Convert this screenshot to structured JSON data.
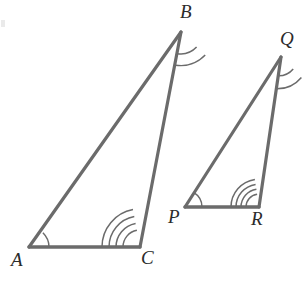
{
  "figure": {
    "type": "geometry-diagram",
    "background_color": "#ffffff",
    "stroke_color": "#6b6b6b",
    "arc_color": "#6b6b6b",
    "label_color": "#2b2b2b",
    "stroke_width": 3.2,
    "arc_width": 1.5,
    "width": 305,
    "height": 288
  },
  "triangles": [
    {
      "name": "triangle-ABC",
      "vertices": [
        {
          "label": "A",
          "x": 29,
          "y": 247,
          "label_x": 11,
          "label_y": 250,
          "arc_count": 1,
          "arc_radius": 20
        },
        {
          "label": "B",
          "x": 181,
          "y": 32,
          "label_x": 180,
          "label_y": 2,
          "arc_count": 2,
          "arc_radius": 22
        },
        {
          "label": "C",
          "x": 140,
          "y": 247,
          "label_x": 141,
          "label_y": 248,
          "arc_count": 4,
          "arc_radius": 38
        }
      ],
      "sides": [
        {
          "name": "side-AB",
          "from": "A",
          "to": "B"
        },
        {
          "name": "side-BC",
          "from": "B",
          "to": "C"
        },
        {
          "name": "side-AC",
          "from": "A",
          "to": "C"
        }
      ]
    },
    {
      "name": "triangle-PQR",
      "vertices": [
        {
          "label": "P",
          "x": 185,
          "y": 207,
          "label_x": 168,
          "label_y": 207,
          "arc_count": 1,
          "arc_radius": 17
        },
        {
          "label": "Q",
          "x": 281,
          "y": 57,
          "label_x": 280,
          "label_y": 29,
          "arc_count": 2,
          "arc_radius": 19
        },
        {
          "label": "R",
          "x": 259,
          "y": 207,
          "label_x": 251,
          "label_y": 209,
          "arc_count": 4,
          "arc_radius": 28
        }
      ],
      "sides": [
        {
          "name": "side-PQ",
          "from": "P",
          "to": "Q"
        },
        {
          "name": "side-QR",
          "from": "Q",
          "to": "R"
        },
        {
          "name": "side-PR",
          "from": "P",
          "to": "R"
        }
      ]
    }
  ],
  "artifacts": [
    {
      "name": "scan-edge-mark",
      "x": 1,
      "y": 20,
      "width": 4,
      "height": 7
    }
  ]
}
